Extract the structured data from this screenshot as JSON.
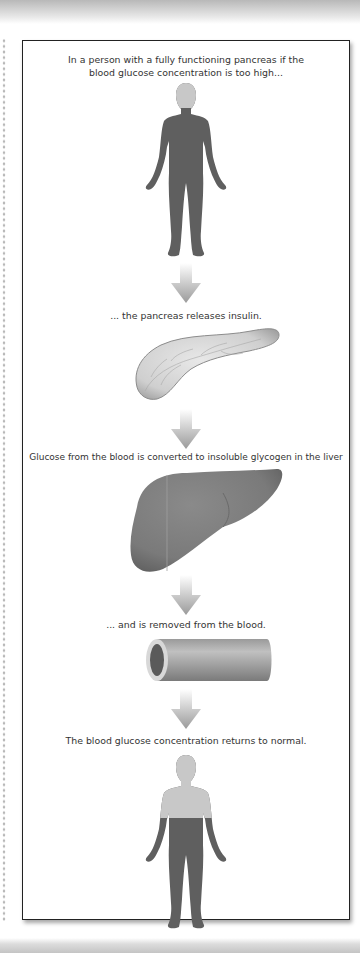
{
  "diagram": {
    "title": "",
    "steps": [
      {
        "caption": "In a person with a fully functioning pancreas if the blood glucose concentration is too high...",
        "image": "human-body-high-glucose-icon"
      },
      {
        "caption": "... the pancreas releases insulin.",
        "image": "pancreas-icon"
      },
      {
        "caption": "Glucose from the blood is converted to insoluble glycogen in the liver",
        "image": "liver-icon"
      },
      {
        "caption": "... and is removed from the blood.",
        "image": "blood-vessel-icon"
      },
      {
        "caption": "The blood glucose concentration returns to normal.",
        "image": "human-body-normal-glucose-icon"
      }
    ],
    "arrows": 4,
    "colors": {
      "body_dark": "#5f5f5f",
      "body_light": "#c8c8c8",
      "organ": "#7a7a7a",
      "pancreas": "#d4d4d4",
      "arrow": "#aaaaaa",
      "border": "#222222"
    }
  }
}
